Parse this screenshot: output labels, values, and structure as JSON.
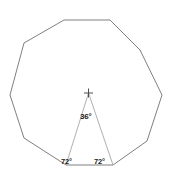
{
  "figure": {
    "background_color": "#ffffff",
    "polygon_stroke_color": "#808080",
    "triangle_stroke_color": "#9a9a9a",
    "center_marker_color": "#4d4d4d",
    "label_color": "#1a1a1a",
    "polygon": {
      "name": "decagon",
      "sides": 10,
      "stroke_width": 1,
      "points": "64,20 110,20 140,50 162,95 147,141 113,165 66,165 24,138 10,95 24,43"
    },
    "triangle": {
      "name": "central-isosceles-triangle",
      "stroke_width": 0.8,
      "apex": "88.5,93",
      "base_left": "66,165",
      "base_right": "113,165",
      "points": "88.5,93 66,165 113,165"
    },
    "center_marker": {
      "name": "center-cross",
      "x": 88.5,
      "y": 93,
      "arm_length": 4.5,
      "stroke_width": 1
    },
    "labels": {
      "central_angle": "36°",
      "base_angle_left": "72°",
      "base_angle_right": "72°"
    }
  }
}
